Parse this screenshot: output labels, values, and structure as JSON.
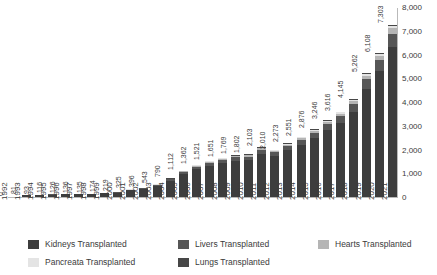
{
  "chart_data": {
    "type": "bar",
    "subtype": "stacked-bar",
    "title": "",
    "xlabel": "",
    "ylabel": "",
    "ylim": [
      0,
      8000
    ],
    "ytick_labels": [
      "0",
      "1,000",
      "2,000",
      "3,000",
      "4,000",
      "5,000",
      "6,000",
      "7,000",
      "8,000"
    ],
    "ytick_values": [
      0,
      1000,
      2000,
      3000,
      4000,
      5000,
      6000,
      7000,
      8000
    ],
    "grid": false,
    "legend_position": "bottom",
    "categories": [
      "1992",
      "1993",
      "1994",
      "1995",
      "1996",
      "1997",
      "1998",
      "1999",
      "2000",
      "2001",
      "2002",
      "2003",
      "2004",
      "2005",
      "2006",
      "2007",
      "2008",
      "2009",
      "2010",
      "2011",
      "2012",
      "2013",
      "2014",
      "2015",
      "2016",
      "2017",
      "2018",
      "2019",
      "2020",
      "2021"
    ],
    "totals": [
      0,
      81,
      93,
      116,
      126,
      136,
      135,
      174,
      219,
      325,
      396,
      543,
      790,
      1112,
      1362,
      1521,
      1651,
      1769,
      1802,
      2103,
      2010,
      2273,
      2551,
      2876,
      3246,
      3616,
      4145,
      5262,
      6108,
      7303
    ],
    "data_labels": [
      "0",
      "81",
      "93",
      "116",
      "126",
      "136",
      "135",
      "174",
      "219",
      "325",
      "396",
      "543",
      "790",
      "1,112",
      "1,362",
      "1,521",
      "1,651",
      "1,769",
      "1,802",
      "2,103",
      "2,010",
      "2,273",
      "2,551",
      "2,876",
      "3,246",
      "3,616",
      "4,145",
      "5,262",
      "6,108",
      "7,303"
    ],
    "series": [
      {
        "name": "Kidneys Transplanted",
        "color": "#3d3d3d",
        "values": [
          0,
          70,
          80,
          100,
          109,
          118,
          117,
          151,
          190,
          282,
          344,
          472,
          687,
          967,
          1184,
          1323,
          1436,
          1539,
          1567,
          1829,
          1748,
          1977,
          2218,
          2501,
          2823,
          3145,
          3605,
          4576,
          5313,
          6353
        ]
      },
      {
        "name": "Livers Transplanted",
        "color": "#565656",
        "values": [
          0,
          6,
          7,
          9,
          10,
          11,
          11,
          14,
          17,
          25,
          31,
          42,
          61,
          86,
          105,
          118,
          128,
          137,
          140,
          163,
          156,
          176,
          198,
          223,
          252,
          281,
          322,
          409,
          474,
          567
        ]
      },
      {
        "name": "Hearts Transplanted",
        "color": "#b5b5b5",
        "values": [
          0,
          3,
          3,
          4,
          4,
          4,
          4,
          5,
          7,
          10,
          12,
          16,
          24,
          33,
          41,
          46,
          50,
          53,
          54,
          63,
          60,
          68,
          77,
          86,
          97,
          108,
          124,
          158,
          183,
          219
        ]
      },
      {
        "name": "Pancreata Transplanted",
        "color": "#e4e4e4",
        "values": [
          0,
          1,
          2,
          2,
          2,
          2,
          2,
          3,
          4,
          5,
          6,
          8,
          12,
          16,
          20,
          23,
          25,
          27,
          27,
          31,
          30,
          34,
          38,
          43,
          48,
          54,
          62,
          79,
          91,
          109
        ]
      },
      {
        "name": "Lungs Transplanted",
        "color": "#474747",
        "values": [
          0,
          1,
          1,
          1,
          1,
          1,
          1,
          1,
          1,
          3,
          3,
          5,
          6,
          10,
          12,
          11,
          12,
          13,
          14,
          17,
          16,
          18,
          20,
          23,
          26,
          28,
          32,
          40,
          47,
          55
        ]
      }
    ]
  },
  "legend": {
    "items": [
      {
        "label": "Kidneys Transplanted",
        "color": "#3d3d3d",
        "column": "col1"
      },
      {
        "label": "Livers Transplanted",
        "color": "#565656",
        "column": "col2"
      },
      {
        "label": "Hearts Transplanted",
        "color": "#b5b5b5",
        "column": "col3"
      },
      {
        "label": "Pancreata Transplanted",
        "color": "#e4e4e4",
        "column": "col1"
      },
      {
        "label": "Lungs Transplanted",
        "color": "#474747",
        "column": "col2"
      }
    ]
  }
}
